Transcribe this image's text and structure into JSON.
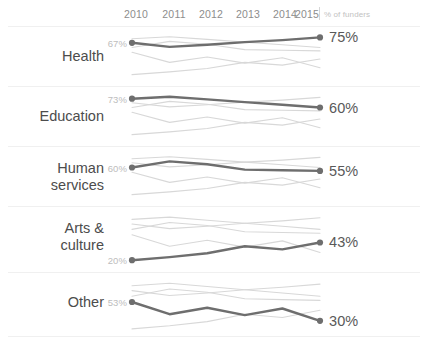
{
  "axis": {
    "years": [
      "2010",
      "2011",
      "2012",
      "2013",
      "2014",
      "2015"
    ],
    "note": "% of funders"
  },
  "rows": [
    {
      "label": "Health",
      "start_value": "67%",
      "end_value": "75%"
    },
    {
      "label": "Education",
      "start_value": "73%",
      "end_value": "60%"
    },
    {
      "label": "Human\nservices",
      "start_value": "60%",
      "end_value": "55%"
    },
    {
      "label": "Arts &\nculture",
      "start_value": "20%",
      "end_value": "43%"
    },
    {
      "label": "Other",
      "start_value": "53%",
      "end_value": "30%"
    }
  ],
  "chart_data": {
    "type": "line",
    "title": "",
    "xlabel": "",
    "ylabel": "% of funders",
    "x": [
      2010,
      2011,
      2012,
      2013,
      2014,
      2015
    ],
    "ylim": [
      15,
      80
    ],
    "grid": false,
    "legend": "none",
    "layout": "small-multiples-sparklines",
    "highlight_color": "#6e6e6e",
    "context_color": "#d8d8d8",
    "series": [
      {
        "name": "Health",
        "values": [
          67,
          61,
          64,
          68,
          71,
          75
        ]
      },
      {
        "name": "Education",
        "values": [
          73,
          76,
          72,
          68,
          64,
          60
        ]
      },
      {
        "name": "Human services",
        "values": [
          60,
          69,
          65,
          57,
          56,
          55
        ]
      },
      {
        "name": "Arts & culture",
        "values": [
          20,
          24,
          29,
          38,
          34,
          43
        ]
      },
      {
        "name": "Other",
        "values": [
          53,
          38,
          46,
          37,
          45,
          30
        ]
      }
    ],
    "panels": [
      {
        "highlight": "Health",
        "start": 67,
        "end": 75
      },
      {
        "highlight": "Education",
        "start": 73,
        "end": 60
      },
      {
        "highlight": "Human services",
        "start": 60,
        "end": 55
      },
      {
        "highlight": "Arts & culture",
        "start": 20,
        "end": 43
      },
      {
        "highlight": "Other",
        "start": 53,
        "end": 30
      }
    ]
  }
}
